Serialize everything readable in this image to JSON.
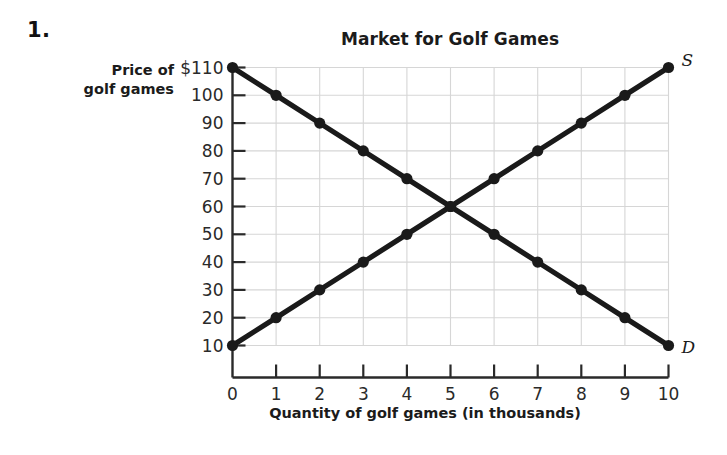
{
  "problem": {
    "number": "1."
  },
  "chart_data": {
    "type": "line",
    "title": "Market for Golf Games",
    "xlabel": "Quantity of golf games (in thousands)",
    "ylabel_line1": "Price of",
    "ylabel_line2": "golf games",
    "x": [
      0,
      1,
      2,
      3,
      4,
      5,
      6,
      7,
      8,
      9,
      10
    ],
    "xlim": [
      0,
      10
    ],
    "ylim": [
      0,
      110
    ],
    "xticks": [
      "0",
      "1",
      "2",
      "3",
      "4",
      "5",
      "6",
      "7",
      "8",
      "9",
      "10"
    ],
    "yticks": [
      "10",
      "20",
      "30",
      "40",
      "50",
      "60",
      "70",
      "80",
      "90",
      "100",
      "$110"
    ],
    "ytick_values": [
      10,
      20,
      30,
      40,
      50,
      60,
      70,
      80,
      90,
      100,
      110
    ],
    "grid": true,
    "legend_position": "inline-end-of-line",
    "series": [
      {
        "name": "D",
        "label": "D",
        "description": "Demand curve",
        "values": [
          110,
          100,
          90,
          80,
          70,
          60,
          50,
          40,
          30,
          20,
          10
        ],
        "color": "#1a1a1a",
        "label_x": 10,
        "label_y": 10
      },
      {
        "name": "S",
        "label": "S",
        "description": "Supply curve",
        "values": [
          10,
          20,
          30,
          40,
          50,
          60,
          70,
          80,
          90,
          100,
          110
        ],
        "color": "#1a1a1a",
        "label_x": 10,
        "label_y": 110
      }
    ],
    "equilibrium": {
      "quantity": 5,
      "price": 60
    },
    "colors": {
      "line": "#1a1a1a",
      "grid": "#d6d6d6",
      "axis": "#2a2a2a",
      "text": "#1b1b1b",
      "background": "#ffffff"
    }
  }
}
